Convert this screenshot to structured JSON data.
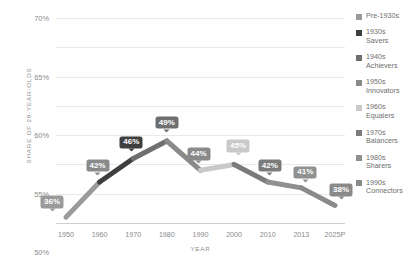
{
  "chart_data": {
    "type": "line",
    "title": "",
    "xlabel": "YEAR",
    "ylabel": "SHARE OF 28-YEAR-OLDS",
    "categories": [
      "1950",
      "1960",
      "1970",
      "1980",
      "1990",
      "2000",
      "2010",
      "2013",
      "2025P"
    ],
    "values": [
      36,
      42,
      46,
      49,
      44,
      45,
      42,
      41,
      38
    ],
    "point_labels": [
      "36%",
      "42%",
      "46%",
      "49%",
      "44%",
      "45%",
      "42%",
      "41%",
      "38%"
    ],
    "ylim": [
      35,
      70
    ],
    "yticks": [
      35,
      40,
      45,
      50,
      55,
      60,
      65,
      70
    ],
    "ytick_labels": [
      "35%",
      "40%",
      "45%",
      "50%",
      "55%",
      "60%",
      "65%",
      "70%"
    ],
    "grid": true,
    "legend_position": "right",
    "segment_colors": [
      "#9a9a9a",
      "#3f3f3f",
      "#6f6f6f",
      "#8a8a8a",
      "#c9c9c9",
      "#7b7b7b",
      "#909090",
      "#8a8a8a"
    ],
    "label_colors": [
      "#9a9a9a",
      "#8a8a8a",
      "#3f3f3f",
      "#6f6f6f",
      "#8a8a8a",
      "#c9c9c9",
      "#7b7b7b",
      "#909090",
      "#8a8a8a"
    ],
    "series": [
      {
        "name": "Share of 28-year-olds",
        "values": [
          36,
          42,
          46,
          49,
          44,
          45,
          42,
          41,
          38
        ]
      }
    ]
  },
  "legend": {
    "items": [
      {
        "label": "Pre-1930s",
        "color": "#9a9a9a"
      },
      {
        "label": "1930s\nSavers",
        "color": "#3f3f3f"
      },
      {
        "label": "1940s\nAchievers",
        "color": "#6f6f6f"
      },
      {
        "label": "1950s\nInnovators",
        "color": "#8a8a8a"
      },
      {
        "label": "1960s\nEqualers",
        "color": "#c9c9c9"
      },
      {
        "label": "1970s\nBalancers",
        "color": "#7b7b7b"
      },
      {
        "label": "1980s\nSharers",
        "color": "#909090"
      },
      {
        "label": "1990s\nConnectors",
        "color": "#8a8a8a"
      }
    ]
  },
  "colors": {
    "gridline": "#e9e9e9",
    "axis": "#cfcfcf",
    "tick_text": "#8a8a8a",
    "axis_title": "#8d8d8d",
    "legend_text": "#6e6e6e",
    "background": "#ffffff"
  }
}
